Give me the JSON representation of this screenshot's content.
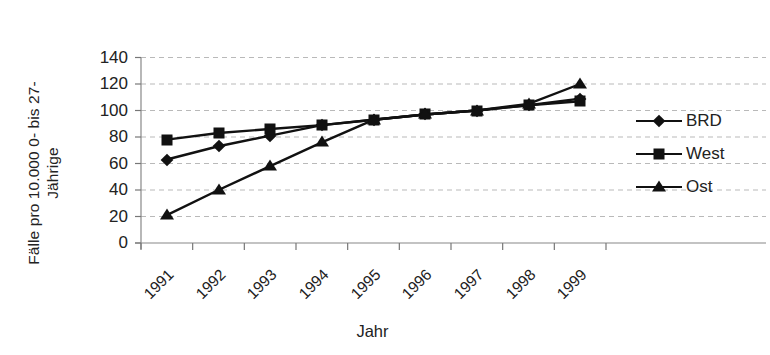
{
  "chart_data": {
    "type": "line",
    "title": "",
    "xlabel": "Jahr",
    "ylabel": "Fälle pro 10.000 0- bis 27-\nJährige",
    "ylabel_line1": "Fälle pro 10.000 0- bis 27-",
    "ylabel_line2": "Jährige",
    "categories": [
      "1991",
      "1992",
      "1993",
      "1994",
      "1995",
      "1996",
      "1997",
      "1998",
      "1999"
    ],
    "ylim": [
      0,
      140
    ],
    "yticks": [
      0,
      20,
      40,
      60,
      80,
      100,
      120,
      140
    ],
    "ytick_labels": [
      "0",
      "20",
      "40",
      "60",
      "80",
      "100",
      "120",
      "140"
    ],
    "grid": "horizontal-dashed",
    "legend_position": "right",
    "series": [
      {
        "name": "BRD",
        "marker": "diamond",
        "color": "#111111",
        "values": [
          63,
          73,
          81,
          89,
          93,
          97,
          100,
          104,
          109
        ]
      },
      {
        "name": "West",
        "marker": "square",
        "color": "#111111",
        "values": [
          78,
          83,
          86,
          89,
          93,
          97,
          100,
          104,
          107
        ]
      },
      {
        "name": "Ost",
        "marker": "triangle",
        "color": "#111111",
        "values": [
          21,
          40,
          58,
          76,
          93,
          97,
          100,
          105,
          120
        ]
      }
    ]
  },
  "axes": {
    "y_title": "Fälle pro 10.000 0- bis 27-\nJährige",
    "x_title": "Jahr"
  },
  "legend": {
    "items": [
      {
        "label": "BRD",
        "marker": "diamond"
      },
      {
        "label": "West",
        "marker": "square"
      },
      {
        "label": "Ost",
        "marker": "triangle"
      }
    ]
  }
}
